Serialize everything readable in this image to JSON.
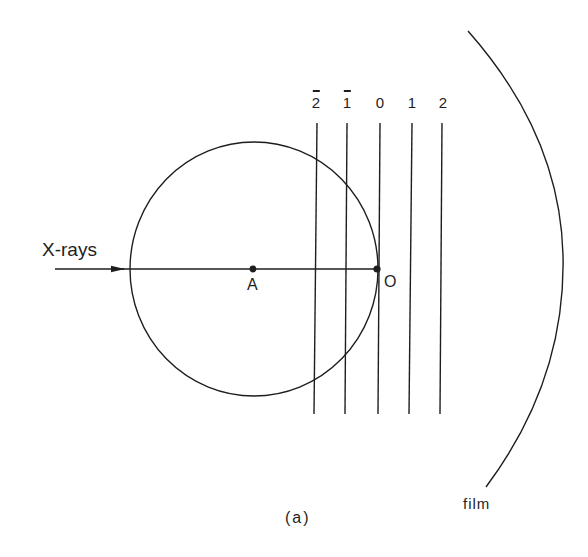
{
  "figure": {
    "caption": "(a)",
    "incident_beam_label": "X-rays",
    "center_label": "A",
    "origin_label": "O",
    "film_label": "film",
    "stroke_color": "#1e1e1e",
    "background_color": "#ffffff"
  },
  "reciprocal_lattice_planes": [
    {
      "index": "2",
      "negative": true,
      "x": 316
    },
    {
      "index": "1",
      "negative": true,
      "x": 347
    },
    {
      "index": "0",
      "negative": false,
      "x": 379
    },
    {
      "index": "1",
      "negative": false,
      "x": 411
    },
    {
      "index": "2",
      "negative": false,
      "x": 442
    }
  ],
  "geometry": {
    "sphere_center": [
      253,
      269
    ],
    "sphere_radius": 124,
    "beam_y": 269,
    "beam_start_x": 55,
    "beam_end_x": 379,
    "plane_top_y": 123,
    "plane_bottom_y": 414
  }
}
